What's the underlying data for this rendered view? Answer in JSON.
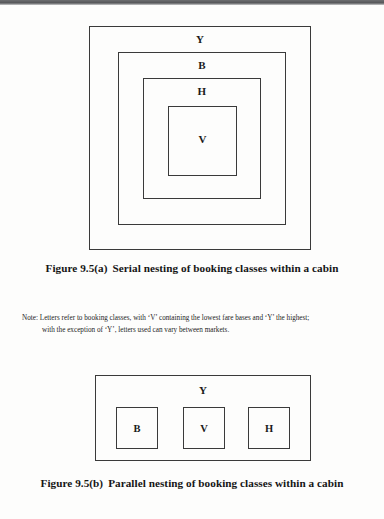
{
  "page": {
    "background_color": "#fdfdfc",
    "ink_color": "#1a1a1a"
  },
  "figure_a": {
    "id": "figure-9-5-a",
    "type": "serial-nesting-diagram",
    "caption_number": "Figure 9.5(a)",
    "caption_text": "Serial nesting of booking classes within a cabin",
    "boxes": [
      {
        "label": "Y",
        "level": 1,
        "name": "booking-class-box-y"
      },
      {
        "label": "B",
        "level": 2,
        "name": "booking-class-box-b"
      },
      {
        "label": "H",
        "level": 3,
        "name": "booking-class-box-h"
      },
      {
        "label": "V",
        "level": 4,
        "name": "booking-class-box-v"
      }
    ]
  },
  "note": {
    "label": "Note:",
    "line1": "Letters refer to booking classes, with ‘V’ containing the lowest fare bases and ‘Y’ the highest;",
    "line2": "with the exception of ‘Y’, letters used can vary between markets."
  },
  "figure_b": {
    "id": "figure-9-5-b",
    "type": "parallel-nesting-diagram",
    "caption_number": "Figure 9.5(b)",
    "caption_text": "Parallel nesting of booking classes within a cabin",
    "outer_box_label": "Y",
    "inner_boxes": [
      {
        "label": "B",
        "name": "booking-class-box-b"
      },
      {
        "label": "V",
        "name": "booking-class-box-v"
      },
      {
        "label": "H",
        "name": "booking-class-box-h"
      }
    ]
  }
}
